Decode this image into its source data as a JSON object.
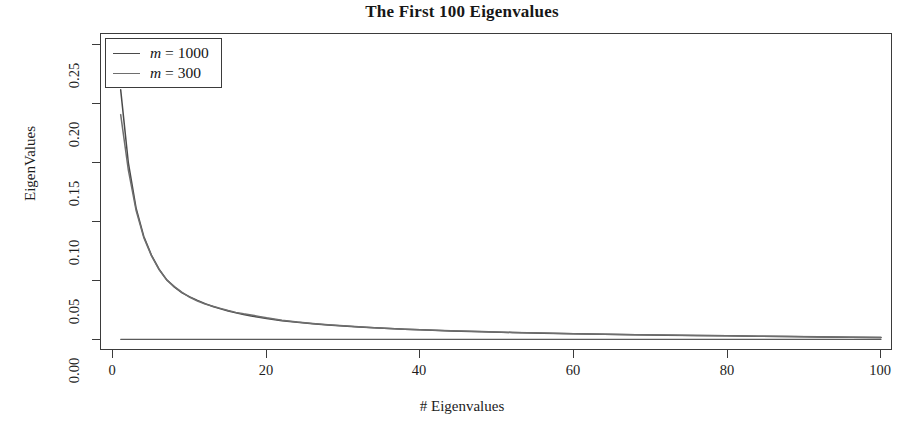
{
  "chart_data": {
    "type": "line",
    "title": "The First 100 Eigenvalues",
    "xlabel": "# Eigenvalues",
    "ylabel": "EigenValues",
    "xlim": [
      0,
      100
    ],
    "ylim": [
      0.0,
      0.25
    ],
    "xticks": [
      0,
      20,
      40,
      60,
      80,
      100
    ],
    "xticklabels": [
      "0",
      "20",
      "40",
      "60",
      "80",
      "100"
    ],
    "yticks": [
      0.0,
      0.05,
      0.1,
      0.15,
      0.2,
      0.25
    ],
    "yticklabels": [
      "0.00",
      "0.05",
      "0.10",
      "0.15",
      "0.20",
      "0.25"
    ],
    "grid": false,
    "legend_position": "upper left",
    "frame": true,
    "background": "#ffffff",
    "series": [
      {
        "name": "m = 1000",
        "color": "#4a4a4a",
        "x": [
          1,
          2,
          3,
          4,
          5,
          6,
          7,
          8,
          9,
          10,
          11,
          12,
          13,
          14,
          15,
          16,
          17,
          18,
          19,
          20,
          22,
          24,
          26,
          28,
          30,
          32,
          34,
          36,
          38,
          40,
          44,
          48,
          52,
          56,
          60,
          64,
          68,
          72,
          76,
          80,
          84,
          88,
          92,
          96,
          100
        ],
        "values": [
          0.212,
          0.15,
          0.112,
          0.088,
          0.072,
          0.06,
          0.051,
          0.0448,
          0.04,
          0.0366,
          0.0336,
          0.0308,
          0.0284,
          0.0264,
          0.0246,
          0.023,
          0.0216,
          0.0204,
          0.0192,
          0.0182,
          0.0164,
          0.015,
          0.0138,
          0.0127,
          0.0118,
          0.011,
          0.0103,
          0.0097,
          0.0091,
          0.0086,
          0.0077,
          0.007,
          0.0064,
          0.0058,
          0.0053,
          0.0049,
          0.0045,
          0.0041,
          0.0038,
          0.0035,
          0.0032,
          0.0029,
          0.0026,
          0.0024,
          0.0021
        ]
      },
      {
        "name": "m = 300",
        "color": "#6e6e6e",
        "x": [
          1,
          2,
          3,
          4,
          5,
          6,
          7,
          8,
          9,
          10,
          11,
          12,
          13,
          14,
          15,
          16,
          17,
          18,
          19,
          20,
          22,
          24,
          26,
          28,
          30,
          32,
          34,
          36,
          38,
          40,
          44,
          48,
          52,
          56,
          60,
          64,
          68,
          72,
          76,
          80,
          84,
          88,
          92,
          96,
          100
        ],
        "values": [
          0.191,
          0.144,
          0.11,
          0.087,
          0.0715,
          0.0596,
          0.0508,
          0.0452,
          0.0404,
          0.0362,
          0.033,
          0.0304,
          0.0286,
          0.0268,
          0.025,
          0.0234,
          0.0222,
          0.0212,
          0.02,
          0.0188,
          0.0168,
          0.0152,
          0.014,
          0.0129,
          0.012,
          0.0112,
          0.0104,
          0.0098,
          0.0092,
          0.0087,
          0.0078,
          0.0071,
          0.0064,
          0.0059,
          0.0054,
          0.0049,
          0.0045,
          0.0042,
          0.0038,
          0.0035,
          0.0032,
          0.0029,
          0.0027,
          0.0024,
          0.0022
        ]
      },
      {
        "name": "baseline",
        "color": "#5a5a5a",
        "x": [
          1,
          100
        ],
        "values": [
          0.0006,
          0.0006
        ]
      }
    ]
  },
  "legend": {
    "items": [
      {
        "label_prefix": "m",
        "label_value": "1000",
        "label": "m = 1000"
      },
      {
        "label_prefix": "m",
        "label_value": "300",
        "label": "m = 300"
      }
    ]
  }
}
